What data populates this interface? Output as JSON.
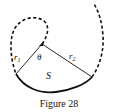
{
  "figure": {
    "caption": "Figure 28",
    "labels": {
      "r1": "r",
      "r1_sub": "1",
      "r2": "r",
      "r2_sub": "2",
      "angle": "θ",
      "area": "S"
    },
    "colors": {
      "stroke": "#111111",
      "background": "#ffffff"
    }
  }
}
